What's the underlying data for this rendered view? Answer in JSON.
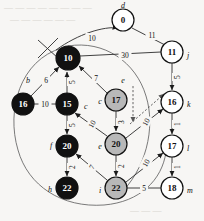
{
  "figure": {
    "background_color": "#f7f6f4",
    "fill_black": "#111111",
    "fill_gray": "#b8b8b8",
    "fill_white": "#ffffff"
  },
  "nodes": [
    {
      "id": "d",
      "value": "0",
      "name": "d",
      "x": 123,
      "y": 20,
      "r": 11,
      "fill": "white",
      "name_dx": 0,
      "name_dy": -15,
      "name_anchor": "middle"
    },
    {
      "id": "j",
      "value": "11",
      "name": "j",
      "x": 172,
      "y": 52,
      "r": 11,
      "fill": "white",
      "name_dx": 14,
      "name_dy": 3,
      "name_anchor": "start"
    },
    {
      "id": "a",
      "value": "10",
      "name": "",
      "x": 68,
      "y": 58,
      "r": 12,
      "fill": "black",
      "name_dx": 0,
      "name_dy": 0,
      "name_anchor": "middle"
    },
    {
      "id": "b",
      "value": "16",
      "name": "",
      "x": 23,
      "y": 104,
      "r": 11,
      "fill": "black",
      "name_dx": 0,
      "name_dy": 0,
      "name_anchor": "middle"
    },
    {
      "id": "c",
      "value": "15",
      "name": "",
      "x": 67,
      "y": 104,
      "r": 11,
      "fill": "black",
      "name_dx": 0,
      "name_dy": 0,
      "name_anchor": "middle"
    },
    {
      "id": "e17",
      "value": "17",
      "name": "",
      "x": 116,
      "y": 100,
      "r": 11,
      "fill": "gray",
      "name_dx": 0,
      "name_dy": 0,
      "name_anchor": "middle"
    },
    {
      "id": "k",
      "value": "16",
      "name": "k",
      "x": 172,
      "y": 102,
      "r": 11,
      "fill": "white",
      "name_dx": 14,
      "name_dy": 2,
      "name_anchor": "start"
    },
    {
      "id": "f",
      "value": "20",
      "name": "",
      "x": 67,
      "y": 146,
      "r": 11,
      "fill": "black",
      "name_dx": 0,
      "name_dy": 0,
      "name_anchor": "middle"
    },
    {
      "id": "e20",
      "value": "20",
      "name": "",
      "x": 116,
      "y": 144,
      "r": 11,
      "fill": "gray",
      "name_dx": 0,
      "name_dy": 0,
      "name_anchor": "middle"
    },
    {
      "id": "l",
      "value": "17",
      "name": "l",
      "x": 172,
      "y": 146,
      "r": 11,
      "fill": "white",
      "name_dx": 14,
      "name_dy": 2,
      "name_anchor": "start"
    },
    {
      "id": "h",
      "value": "22",
      "name": "",
      "x": 67,
      "y": 188,
      "r": 11,
      "fill": "black",
      "name_dx": 0,
      "name_dy": 0,
      "name_anchor": "middle"
    },
    {
      "id": "i",
      "value": "22",
      "name": "",
      "x": 116,
      "y": 188,
      "r": 11,
      "fill": "gray",
      "name_dx": 0,
      "name_dy": 0,
      "name_anchor": "middle"
    },
    {
      "id": "m",
      "value": "18",
      "name": "m",
      "x": 172,
      "y": 188,
      "r": 11,
      "fill": "white",
      "name_dx": 14,
      "name_dy": 2,
      "name_anchor": "start"
    }
  ],
  "vertex_names": [
    {
      "text": "d",
      "x": 123,
      "y": 5,
      "anchor": "middle"
    },
    {
      "text": "j",
      "x": 187,
      "y": 55,
      "anchor": "start"
    },
    {
      "text": "b",
      "x": 28,
      "y": 80,
      "anchor": "middle"
    },
    {
      "text": "c",
      "x": 84,
      "y": 106,
      "anchor": "start"
    },
    {
      "text": "c",
      "x": 100,
      "y": 101,
      "anchor": "middle"
    },
    {
      "text": "e",
      "x": 123,
      "y": 80,
      "anchor": "middle"
    },
    {
      "text": "k",
      "x": 187,
      "y": 104,
      "anchor": "start"
    },
    {
      "text": "f",
      "x": 51,
      "y": 145,
      "anchor": "middle"
    },
    {
      "text": "e",
      "x": 100,
      "y": 146,
      "anchor": "middle"
    },
    {
      "text": "l",
      "x": 187,
      "y": 148,
      "anchor": "start"
    },
    {
      "text": "h",
      "x": 50,
      "y": 189,
      "anchor": "middle"
    },
    {
      "text": "i",
      "x": 100,
      "y": 190,
      "anchor": "middle"
    },
    {
      "text": "m",
      "x": 187,
      "y": 190,
      "anchor": "start"
    }
  ],
  "edges": [
    {
      "from": "a",
      "to": "d",
      "weight": "10",
      "label_x": 92,
      "label_y": 38,
      "rotate": 0,
      "style": "curve"
    },
    {
      "from": "d",
      "to": "j",
      "weight": "11",
      "label_x": 152,
      "label_y": 35,
      "rotate": 0,
      "style": "line"
    },
    {
      "from": "a",
      "to": "j",
      "weight": "30",
      "label_x": 125,
      "label_y": 55,
      "rotate": 0,
      "style": "line"
    },
    {
      "from": "b",
      "to": "a",
      "weight": "6",
      "label_x": 46,
      "label_y": 80,
      "rotate": 0,
      "style": "line"
    },
    {
      "from": "b",
      "to": "c",
      "weight": "10",
      "label_x": 45,
      "label_y": 104,
      "rotate": 0,
      "style": "line"
    },
    {
      "from": "c",
      "to": "a",
      "weight": "5",
      "label_x": 72,
      "label_y": 82,
      "rotate": -90,
      "style": "line"
    },
    {
      "from": "e17",
      "to": "a",
      "weight": "7",
      "label_x": 96,
      "label_y": 78,
      "rotate": 0,
      "style": "line"
    },
    {
      "from": "e17",
      "to": "e20",
      "weight": "3",
      "label_x": 121,
      "label_y": 122,
      "rotate": -90,
      "style": "line"
    },
    {
      "from": "e20",
      "to": "c",
      "weight": "10",
      "label_x": 92,
      "label_y": 124,
      "rotate": -62,
      "style": "line"
    },
    {
      "from": "c",
      "to": "f",
      "weight": "5",
      "label_x": 72,
      "label_y": 125,
      "rotate": -90,
      "style": "line"
    },
    {
      "from": "f",
      "to": "h",
      "weight": "2",
      "label_x": 72,
      "label_y": 167,
      "rotate": -90,
      "style": "line"
    },
    {
      "from": "i",
      "to": "f",
      "weight": "7",
      "label_x": 92,
      "label_y": 167,
      "rotate": -62,
      "style": "line"
    },
    {
      "from": "e20",
      "to": "i",
      "weight": "2",
      "label_x": 121,
      "label_y": 166,
      "rotate": -90,
      "style": "line"
    },
    {
      "from": "j",
      "to": "k",
      "weight": "5",
      "label_x": 177,
      "label_y": 77,
      "rotate": -90,
      "style": "line"
    },
    {
      "from": "k",
      "to": "l",
      "weight": "1",
      "label_x": 177,
      "label_y": 124,
      "rotate": -90,
      "style": "line"
    },
    {
      "from": "l",
      "to": "m",
      "weight": "1",
      "label_x": 177,
      "label_y": 167,
      "rotate": -90,
      "style": "line"
    },
    {
      "from": "e20",
      "to": "k",
      "weight": "10",
      "label_x": 146,
      "label_y": 122,
      "rotate": -62,
      "style": "line"
    },
    {
      "from": "i",
      "to": "l",
      "weight": "10",
      "label_x": 146,
      "label_y": 163,
      "rotate": -62,
      "style": "line"
    },
    {
      "from": "i",
      "to": "m",
      "weight": "5",
      "label_x": 144,
      "label_y": 188,
      "rotate": 0,
      "style": "line"
    }
  ],
  "annotations": {
    "cross_mark": "x-strike-through-edge",
    "dashed_arrow_down": "dashed-pointer-down",
    "dashed_arrow_up": "dashed-pointer-up-right",
    "big_arc": "enclosing-contour"
  },
  "ghost_text": [
    {
      "text": "— — — — — — — —",
      "x": 4,
      "y": 2
    },
    {
      "text": "— — — — — —",
      "x": 10,
      "y": 14
    },
    {
      "text": "— — —",
      "x": 130,
      "y": 205
    }
  ]
}
